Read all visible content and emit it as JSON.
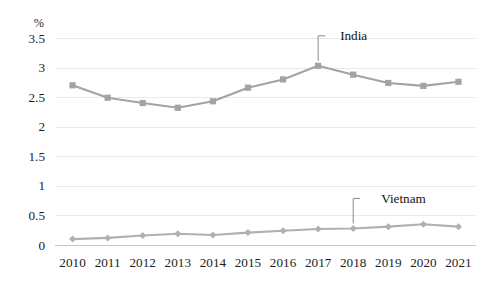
{
  "chart_data": {
    "type": "line",
    "title": "",
    "subtitle": "",
    "xlabel": "",
    "ylabel": "",
    "unit_label": "%",
    "categories": [
      "2010",
      "2011",
      "2012",
      "2013",
      "2014",
      "2015",
      "2016",
      "2017",
      "2018",
      "2019",
      "2020",
      "2021"
    ],
    "x": [
      2010,
      2011,
      2012,
      2013,
      2014,
      2015,
      2016,
      2017,
      2018,
      2019,
      2020,
      2021
    ],
    "ylim": [
      0,
      3.5
    ],
    "ytick_labels": [
      "3.5",
      "3",
      "2.5",
      "2",
      "1.5",
      "1",
      "0.5",
      "0"
    ],
    "ytick_values": [
      3.5,
      3,
      2.5,
      2,
      1.5,
      1,
      0.5,
      0
    ],
    "grid": true,
    "grid_axis": "y",
    "legend_position": "inline-annotation",
    "series": [
      {
        "name": "India",
        "marker": "square",
        "color": "#a3a3a3",
        "values": [
          2.7,
          2.49,
          2.4,
          2.32,
          2.43,
          2.66,
          2.8,
          3.03,
          2.88,
          2.74,
          2.69,
          2.76
        ],
        "annotation": {
          "text": "India",
          "anchor_category": "2017",
          "anchor_value": 3.03
        }
      },
      {
        "name": "Vietnam",
        "marker": "diamond",
        "color": "#b0b0b0",
        "values": [
          0.1,
          0.12,
          0.16,
          0.19,
          0.17,
          0.21,
          0.24,
          0.27,
          0.28,
          0.31,
          0.35,
          0.31
        ],
        "annotation": {
          "text": "Vietnam",
          "anchor_category": "2018",
          "anchor_value": 0.28
        }
      }
    ],
    "colors": {
      "india_line": "#a3a3a3",
      "vietnam_line": "#b0b0b0",
      "gridline": "#e9e9e9",
      "axis_line": "#c9c9c9",
      "text": "#1d1d1d",
      "background": "#ffffff"
    }
  },
  "annotations": {
    "india_label": "India",
    "vietnam_label": "Vietnam"
  }
}
